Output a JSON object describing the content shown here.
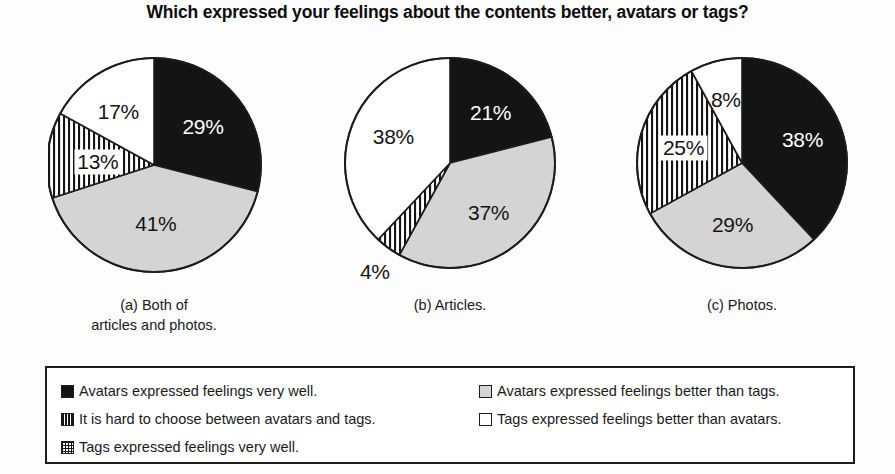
{
  "title": "Which expressed your feelings about the contents better, avatars or tags?",
  "colors": {
    "very_well_avatars": "#141414",
    "hard_to_choose": "#ffffff",
    "tags_very_well": "#ffffff",
    "avatars_better": "#d4d4d4",
    "tags_better": "#ffffff",
    "outline": "#1c1c1c",
    "background": "#fdfdfd"
  },
  "chart_data": {
    "type": "pie",
    "title": "Which expressed your feelings about the contents better, avatars or tags?",
    "legend_position": "bottom",
    "categories": [
      "Avatars expressed feelings very well.",
      "Avatars expressed feelings better than tags.",
      "It is hard to choose between avatars and tags.",
      "Tags expressed feelings better than avatars."
    ],
    "charts": [
      {
        "id": "a",
        "caption_line1": "(a) Both of",
        "caption_line2": "articles and photos.",
        "slices": [
          {
            "label": "29%",
            "value": 29,
            "fill": "black",
            "name": "avatars-very-well"
          },
          {
            "label": "41%",
            "value": 41,
            "fill": "lightgray",
            "name": "avatars-better-than-tags"
          },
          {
            "label": "13%",
            "value": 13,
            "fill": "vstripe",
            "name": "hard-to-choose"
          },
          {
            "label": "17%",
            "value": 17,
            "fill": "white",
            "name": "tags-better-than-avatars"
          }
        ]
      },
      {
        "id": "b",
        "caption_line1": "(b) Articles.",
        "caption_line2": "",
        "slices": [
          {
            "label": "21%",
            "value": 21,
            "fill": "black",
            "name": "avatars-very-well"
          },
          {
            "label": "37%",
            "value": 37,
            "fill": "lightgray",
            "name": "avatars-better-than-tags"
          },
          {
            "label": "4%",
            "value": 4,
            "fill": "vstripe",
            "name": "hard-to-choose"
          },
          {
            "label": "38%",
            "value": 38,
            "fill": "white",
            "name": "tags-better-than-avatars"
          }
        ]
      },
      {
        "id": "c",
        "caption_line1": "(c) Photos.",
        "caption_line2": "",
        "slices": [
          {
            "label": "38%",
            "value": 38,
            "fill": "black",
            "name": "avatars-very-well"
          },
          {
            "label": "29%",
            "value": 29,
            "fill": "lightgray",
            "name": "avatars-better-than-tags"
          },
          {
            "label": "25%",
            "value": 25,
            "fill": "vstripe",
            "name": "hard-to-choose"
          },
          {
            "label": "8%",
            "value": 8,
            "fill": "white",
            "name": "tags-better-than-avatars"
          }
        ]
      }
    ]
  },
  "legend": {
    "left_items": [
      {
        "swatch": "solid-black",
        "text": "Avatars expressed feelings very well."
      },
      {
        "swatch": "vstripe",
        "text": "It is hard to choose between avatars and tags."
      },
      {
        "swatch": "crosshatch",
        "text": "Tags expressed feelings very well."
      }
    ],
    "right_items": [
      {
        "swatch": "lightgray",
        "text": "Avatars expressed feelings better than tags."
      },
      {
        "swatch": "white",
        "text": "Tags expressed feelings better than avatars."
      }
    ]
  }
}
